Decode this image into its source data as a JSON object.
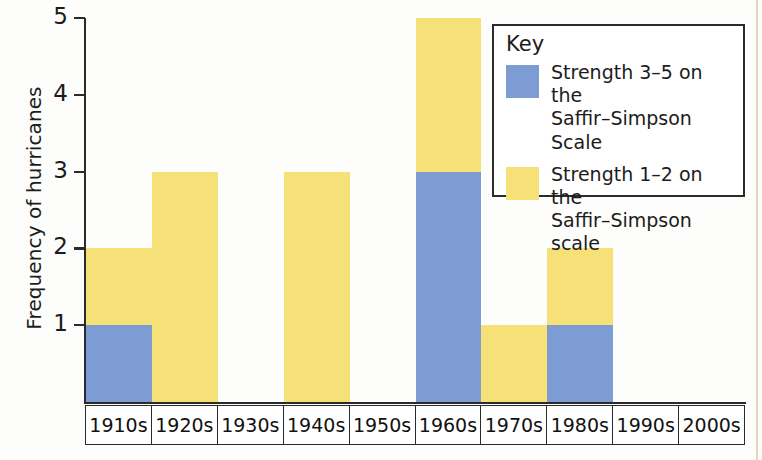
{
  "chart_data": {
    "type": "bar",
    "stacked": true,
    "title": "",
    "xlabel": "",
    "ylabel": "Frequency of hurricanes",
    "ylim": [
      0,
      5
    ],
    "yticks": [
      1,
      2,
      3,
      4,
      5
    ],
    "ytick_labels": [
      "1",
      "2",
      "3",
      "4",
      "5"
    ],
    "grid": false,
    "legend_position": "top-right",
    "categories": [
      "1910s",
      "1920s",
      "1930s",
      "1940s",
      "1950s",
      "1960s",
      "1970s",
      "1980s",
      "1990s",
      "2000s"
    ],
    "series": [
      {
        "name": "Strength 3–5 on the Saffir–Simpson Scale",
        "color": "#7e9cd4",
        "values": [
          1,
          0,
          0,
          0,
          0,
          3,
          0,
          1,
          0,
          0
        ]
      },
      {
        "name": "Strength 1–2 on the Saffir–Simpson scale",
        "color": "#f6e179",
        "values": [
          1,
          3,
          0,
          3,
          0,
          2,
          1,
          1,
          0,
          0
        ]
      }
    ],
    "totals": [
      2,
      3,
      0,
      3,
      0,
      5,
      1,
      2,
      0,
      0
    ]
  },
  "axes": {
    "y_title": "Frequency of hurricanes",
    "y_ticks": [
      {
        "label": "5",
        "value": 5
      },
      {
        "label": "4",
        "value": 4
      },
      {
        "label": "3",
        "value": 3
      },
      {
        "label": "2",
        "value": 2
      },
      {
        "label": "1",
        "value": 1
      }
    ],
    "x_categories": [
      "1910s",
      "1920s",
      "1930s",
      "1940s",
      "1950s",
      "1960s",
      "1970s",
      "1980s",
      "1990s",
      "2000s"
    ]
  },
  "legend": {
    "title": "Key",
    "entries": [
      {
        "swatch_color": "#7e9cd4",
        "swatch_name": "legend-swatch-strength-3-5",
        "text": "Strength 3–5 on the\nSaffir–Simpson Scale"
      },
      {
        "swatch_color": "#f6e179",
        "swatch_name": "legend-swatch-strength-1-2",
        "text": "Strength 1–2 on the\nSaffir–Simpson scale"
      }
    ]
  },
  "colors": {
    "strength_high": "#7e9cd4",
    "strength_low": "#f6e179",
    "axis": "#2b2b2b",
    "text": "#1c1c1c",
    "background": "#fdfdfb",
    "page_edge": "#d08c5a"
  }
}
